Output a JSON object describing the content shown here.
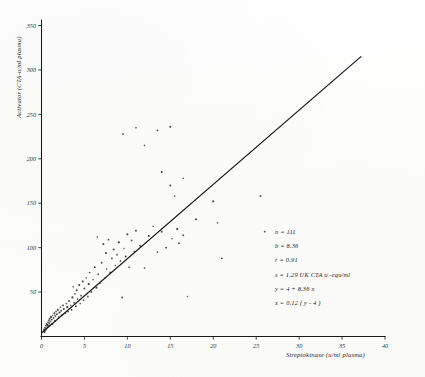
{
  "chart_data": {
    "type": "scatter",
    "title": "",
    "xlabel": "Streptokinase (u/ml plasma)",
    "ylabel": "Activator (CTA-u/ml plasma)",
    "xlim": [
      0,
      40
    ],
    "ylim": [
      0,
      350
    ],
    "xticks": [
      0,
      5,
      10,
      15,
      20,
      25,
      30,
      35,
      40
    ],
    "xtick_labels": [
      "0",
      "5",
      "10",
      "15",
      "20",
      "25",
      "30",
      "35",
      "40"
    ],
    "yticks": [
      50,
      100,
      150,
      200,
      250,
      300,
      350
    ],
    "ytick_labels": [
      "50",
      "100",
      "150",
      "200",
      "250",
      "300",
      "350"
    ],
    "grid": false,
    "legend": false,
    "fit_line": {
      "intercept": 4,
      "slope": 8.36,
      "x_start": 0,
      "x_end": 37.2
    },
    "points": [
      [
        0.25,
        6
      ],
      [
        0.3,
        8
      ],
      [
        0.35,
        5
      ],
      [
        0.4,
        10
      ],
      [
        0.45,
        7
      ],
      [
        0.5,
        12
      ],
      [
        0.55,
        9
      ],
      [
        0.6,
        14
      ],
      [
        0.65,
        11
      ],
      [
        0.7,
        13
      ],
      [
        0.75,
        16
      ],
      [
        0.8,
        12
      ],
      [
        0.85,
        18
      ],
      [
        0.9,
        15
      ],
      [
        0.95,
        20
      ],
      [
        1.0,
        13
      ],
      [
        1.05,
        17
      ],
      [
        1.1,
        22
      ],
      [
        1.2,
        19
      ],
      [
        1.25,
        14
      ],
      [
        1.3,
        24
      ],
      [
        1.4,
        21
      ],
      [
        1.5,
        26
      ],
      [
        1.55,
        18
      ],
      [
        1.6,
        23
      ],
      [
        1.7,
        28
      ],
      [
        1.8,
        25
      ],
      [
        1.9,
        30
      ],
      [
        2.0,
        22
      ],
      [
        2.1,
        27
      ],
      [
        2.2,
        33
      ],
      [
        2.3,
        29
      ],
      [
        2.4,
        24
      ],
      [
        2.5,
        35
      ],
      [
        2.6,
        31
      ],
      [
        2.8,
        26
      ],
      [
        2.9,
        37
      ],
      [
        3.0,
        33
      ],
      [
        3.1,
        28
      ],
      [
        3.2,
        40
      ],
      [
        3.4,
        35
      ],
      [
        3.5,
        30
      ],
      [
        3.6,
        44
      ],
      [
        3.7,
        56
      ],
      [
        3.8,
        38
      ],
      [
        3.9,
        48
      ],
      [
        4.0,
        34
      ],
      [
        4.1,
        52
      ],
      [
        4.2,
        42
      ],
      [
        4.4,
        58
      ],
      [
        4.5,
        37
      ],
      [
        4.6,
        46
      ],
      [
        4.8,
        62
      ],
      [
        4.9,
        41
      ],
      [
        5.0,
        54
      ],
      [
        5.2,
        66
      ],
      [
        5.4,
        45
      ],
      [
        5.5,
        59
      ],
      [
        5.6,
        72
      ],
      [
        5.8,
        50
      ],
      [
        6.0,
        64
      ],
      [
        6.2,
        78
      ],
      [
        6.4,
        55
      ],
      [
        6.5,
        112
      ],
      [
        6.6,
        70
      ],
      [
        6.8,
        60
      ],
      [
        7.0,
        83
      ],
      [
        7.2,
        104
      ],
      [
        7.4,
        66
      ],
      [
        7.5,
        94
      ],
      [
        7.6,
        76
      ],
      [
        7.8,
        109
      ],
      [
        8.0,
        72
      ],
      [
        8.2,
        88
      ],
      [
        8.4,
        98
      ],
      [
        8.6,
        80
      ],
      [
        8.8,
        92
      ],
      [
        9.0,
        106
      ],
      [
        9.2,
        85
      ],
      [
        9.4,
        44
      ],
      [
        9.6,
        99
      ],
      [
        9.8,
        90
      ],
      [
        10.0,
        115
      ],
      [
        10.2,
        78
      ],
      [
        10.5,
        108
      ],
      [
        10.8,
        96
      ],
      [
        11.0,
        119
      ],
      [
        11.5,
        102
      ],
      [
        12.0,
        77
      ],
      [
        12.5,
        113
      ],
      [
        13.0,
        124
      ],
      [
        13.5,
        95
      ],
      [
        14.0,
        118
      ],
      [
        14.5,
        100
      ],
      [
        15.0,
        170
      ],
      [
        15.2,
        110
      ],
      [
        15.5,
        158
      ],
      [
        15.8,
        121
      ],
      [
        16.0,
        105
      ],
      [
        16.5,
        114
      ],
      [
        17.0,
        45
      ],
      [
        18.0,
        132
      ],
      [
        20.0,
        152
      ],
      [
        20.5,
        128
      ],
      [
        9.5,
        228
      ],
      [
        11.0,
        235
      ],
      [
        13.5,
        232
      ],
      [
        15.0,
        236
      ],
      [
        12.0,
        215
      ],
      [
        14.0,
        185
      ],
      [
        16.5,
        178
      ],
      [
        26.0,
        118
      ],
      [
        25.5,
        158
      ],
      [
        21.0,
        88
      ]
    ]
  },
  "annotations": {
    "stats": [
      "n = 111",
      "b = 8.36",
      "r = 0.91",
      "s = 1.29  UK CTA u -equ/ml",
      "y = 4 + 8.36 x",
      "x = 0.12 ( y - 4 )"
    ]
  },
  "colors": {
    "ink": "#1a1a1a",
    "point": "#2a2a2a",
    "paper": "#fefefe"
  }
}
